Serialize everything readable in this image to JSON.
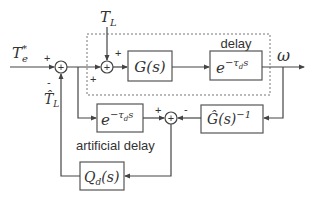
{
  "diagram": {
    "type": "block-diagram",
    "inputs": {
      "reference_torque": {
        "symbol": "T",
        "sub": "e",
        "sup": "*"
      },
      "load_torque": {
        "symbol": "T",
        "sub": "L"
      },
      "estimated_load": {
        "symbol": "T̂",
        "sub": "L"
      }
    },
    "output": {
      "symbol": "ω"
    },
    "blocks": {
      "plant": {
        "label": "G(s)"
      },
      "delay": {
        "label": "e",
        "exp": "−τ",
        "exp_sub": "d",
        "exp_tail": "s",
        "caption": "delay"
      },
      "artificial_delay": {
        "label": "e",
        "exp": "−τ",
        "exp_sub": "d",
        "exp_tail": "s",
        "caption": "artificial delay"
      },
      "inverse_model": {
        "label": "Ĝ(s)",
        "exp": "−1"
      },
      "filter": {
        "label": "Q",
        "sub": "d",
        "tail": "(s)"
      }
    },
    "summing_junctions": {
      "sum1": {
        "signs": {
          "left": "+",
          "bottom": "-"
        }
      },
      "sum2": {
        "signs": {
          "top": "+",
          "left": "+"
        }
      },
      "sum3": {
        "signs": {
          "left": "+",
          "right": "-"
        }
      }
    },
    "sum_glyph": "+"
  }
}
